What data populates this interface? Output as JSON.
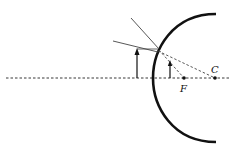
{
  "diagram": {
    "labels": {
      "focal_point": "F",
      "center_of_curvature": "C"
    },
    "colors": {
      "ink": "#111111",
      "ray": "#555555",
      "background": "#ffffff"
    }
  }
}
